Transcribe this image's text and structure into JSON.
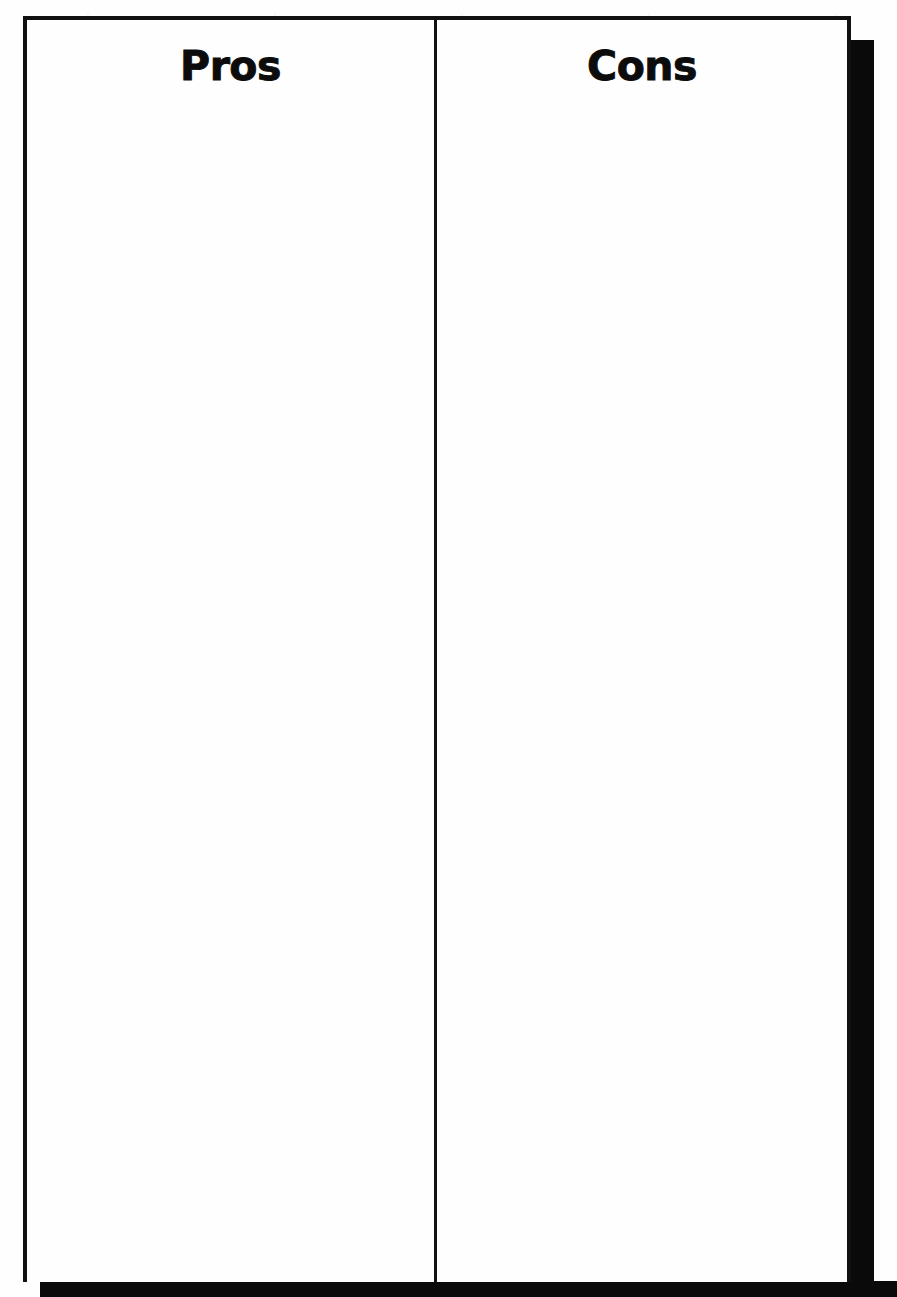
{
  "document": {
    "type": "pros-and-cons-worksheet",
    "title": "Pros and Cons",
    "background_color": "#fefefe",
    "ink_color": "#111111",
    "shadow_color": "#0a0a0a"
  },
  "table": {
    "columns": [
      {
        "id": "pros",
        "header": "Pros",
        "entries": []
      },
      {
        "id": "cons",
        "header": "Cons",
        "entries": []
      }
    ],
    "row_count": 0,
    "body_state": "blank"
  }
}
